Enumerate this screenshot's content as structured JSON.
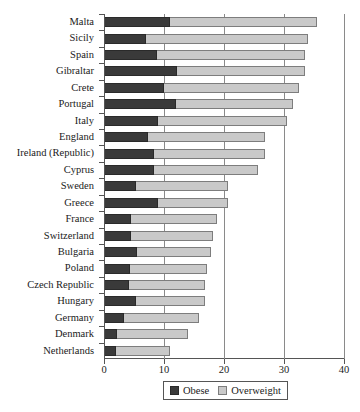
{
  "chart_data": {
    "type": "bar",
    "orientation": "horizontal",
    "stacked": true,
    "title": "",
    "xlabel": "",
    "ylabel": "",
    "xlim": [
      0,
      40
    ],
    "xticks": [
      0,
      10,
      20,
      30,
      40
    ],
    "xtick_labels": [
      "0",
      "10",
      "20",
      "30",
      "40"
    ],
    "grid": true,
    "legend_position": "bottom",
    "categories": [
      "Malta",
      "Sicily",
      "Spain",
      "Gibraltar",
      "Crete",
      "Portugal",
      "Italy",
      "England",
      "Ireland (Republic)",
      "Cyprus",
      "Sweden",
      "Greece",
      "France",
      "Switzerland",
      "Bulgaria",
      "Poland",
      "Czech Republic",
      "Hungary",
      "Germany",
      "Denmark",
      "Netherlands"
    ],
    "series": [
      {
        "name": "Obese",
        "color": "#3a3a3a",
        "values": [
          10.8,
          6.9,
          8.7,
          12.0,
          9.9,
          11.8,
          8.9,
          7.1,
          8.1,
          8.2,
          5.1,
          8.9,
          4.3,
          4.3,
          5.3,
          4.2,
          4.0,
          5.2,
          3.1,
          2.0,
          1.9
        ]
      },
      {
        "name": "Overweight",
        "color": "#c9c9c9",
        "values": [
          24.5,
          26.9,
          24.6,
          21.3,
          22.4,
          19.6,
          21.5,
          19.6,
          18.6,
          17.3,
          15.4,
          11.6,
          14.3,
          13.7,
          12.3,
          12.8,
          12.7,
          11.4,
          12.6,
          11.9,
          8.9
        ]
      }
    ],
    "totals": [
      35.3,
      33.8,
      33.3,
      33.3,
      32.3,
      31.4,
      30.4,
      26.7,
      26.7,
      25.5,
      20.5,
      20.5,
      18.6,
      18.0,
      17.6,
      17.0,
      16.7,
      16.6,
      15.7,
      13.9,
      10.8
    ]
  },
  "legend": {
    "items": [
      {
        "label": "Obese",
        "swatch": "obese"
      },
      {
        "label": "Overweight",
        "swatch": "overweight"
      }
    ]
  }
}
